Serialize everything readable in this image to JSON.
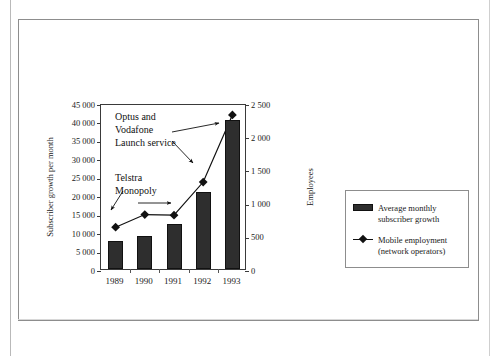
{
  "figure": {
    "caption": "",
    "colors": {
      "bar_fill": "#2e2e2e",
      "line": "#111111",
      "frame": "#8d8d8d",
      "axis": "#3a3a3a",
      "text": "#1a1a1a",
      "background": "#ffffff"
    }
  },
  "chart_data": {
    "type": "bar",
    "title": "",
    "subtitle": "",
    "xlabel": "",
    "ylabel": "Subscriber growth per month",
    "y2label": "Employees",
    "categories": [
      "1989",
      "1990",
      "1991",
      "1992",
      "1993"
    ],
    "ylim": [
      0,
      45000
    ],
    "y2lim": [
      0,
      2500
    ],
    "ytick_labels": [
      "0",
      "5 000",
      "10 000",
      "15 000",
      "20 000",
      "25 000",
      "30 000",
      "35 000",
      "40 000",
      "45 000"
    ],
    "ytick_values": [
      0,
      5000,
      10000,
      15000,
      20000,
      25000,
      30000,
      35000,
      40000,
      45000
    ],
    "y2tick_labels": [
      "0",
      "500",
      "1 000",
      "1 500",
      "2 000",
      "2 500"
    ],
    "y2tick_values": [
      0,
      500,
      1000,
      1500,
      2000,
      2500
    ],
    "grid": false,
    "legend_position": "right",
    "series": [
      {
        "name": "Average monthly subscriber growth",
        "type": "bar",
        "axis": "left",
        "values": [
          7600,
          9000,
          12200,
          20900,
          40400
        ]
      },
      {
        "name": "Mobile employment (network operators)",
        "type": "line",
        "axis": "right",
        "marker": "diamond",
        "values": [
          660,
          850,
          840,
          1340,
          2350
        ]
      }
    ],
    "annotations": [
      {
        "id": "optus-launch",
        "lines": [
          "Optus and",
          "Vodafone",
          "Launch service"
        ],
        "target_category": "1991",
        "arrows": 2
      },
      {
        "id": "telstra-monopoly",
        "lines": [
          "Telstra",
          "Monopoly"
        ],
        "target_category": "1989",
        "arrows": 2
      }
    ]
  },
  "legend": {
    "items": [
      {
        "label": "Average monthly subscriber growth",
        "key": "bar-swatch"
      },
      {
        "label": "Mobile employment (network operators)",
        "key": "line-diamond-marker"
      }
    ]
  }
}
